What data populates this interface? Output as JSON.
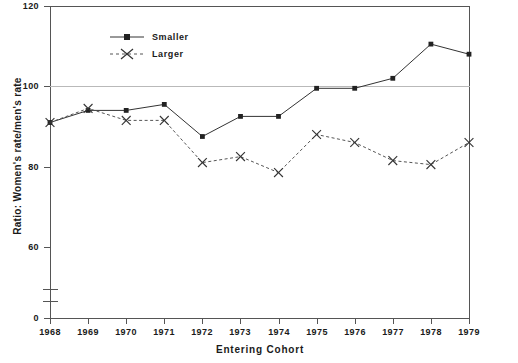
{
  "chart_data": {
    "type": "line",
    "title": "",
    "xlabel": "Entering Cohort",
    "ylabel": "Ratio: Women's rate/men's rate",
    "categories": [
      1968,
      1969,
      1970,
      1971,
      1972,
      1973,
      1974,
      1975,
      1976,
      1977,
      1978,
      1979
    ],
    "xtick_labels": [
      "1968",
      "1969",
      "1970",
      "1971",
      "1972",
      "1973",
      "1974",
      "1975",
      "1976",
      "1977",
      "1978",
      "1979"
    ],
    "ytick_labels": [
      "0",
      "60",
      "80",
      "100",
      "120"
    ],
    "ytick_values": [
      0,
      60,
      80,
      100,
      120
    ],
    "ylim": [
      56,
      120
    ],
    "axis_break": true,
    "axis_break_note": "y-axis broken between 0 and 60",
    "grid": "horizontal gridlines at 100 and 120",
    "legend_position": "top-left inside plot",
    "series": [
      {
        "name": "Smaller",
        "marker": "square",
        "linestyle": "solid",
        "color": "#333333",
        "values": [
          91,
          94,
          94,
          95.5,
          87.5,
          92.5,
          92.5,
          99.5,
          99.5,
          102,
          110.5,
          108
        ]
      },
      {
        "name": "Larger",
        "marker": "x",
        "linestyle": "dashed",
        "color": "#555555",
        "values": [
          91,
          94.5,
          91.5,
          91.5,
          81,
          82.5,
          78.5,
          88,
          86,
          81.5,
          80.5,
          86
        ]
      }
    ]
  },
  "legend": {
    "items": [
      {
        "label": "Smaller"
      },
      {
        "label": "Larger"
      }
    ]
  }
}
